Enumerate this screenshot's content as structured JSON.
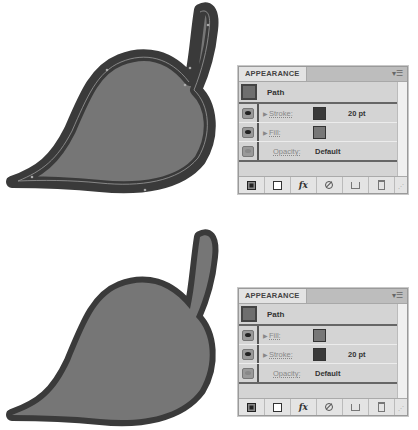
{
  "figures": [
    {
      "leaf": {
        "description": "leaf-with-stroke-selected",
        "fill_color": "#767676",
        "stroke_color": "#3a3a3a",
        "selected": true
      },
      "panel": {
        "title": "APPEARANCE",
        "object": "Path",
        "rows": [
          {
            "type": "stroke",
            "label": "Stroke:",
            "swatch": "#3a3a3a",
            "value": "20 pt"
          },
          {
            "type": "fill",
            "label": "Fill:",
            "swatch": "#777777",
            "value": ""
          },
          {
            "type": "opacity",
            "label": "Opacity:",
            "value": "Default"
          }
        ],
        "footer": [
          "new-stroke-icon",
          "new-fill-icon",
          "fx-icon",
          "clear-icon",
          "duplicate-icon",
          "trash-icon"
        ]
      }
    },
    {
      "leaf": {
        "description": "leaf-with-fill-on-top",
        "fill_color": "#767676",
        "stroke_color": "#3a3a3a",
        "selected": false
      },
      "panel": {
        "title": "APPEARANCE",
        "object": "Path",
        "rows": [
          {
            "type": "fill",
            "label": "Fill:",
            "swatch": "#777777",
            "value": ""
          },
          {
            "type": "stroke",
            "label": "Stroke:",
            "swatch": "#3a3a3a",
            "value": "20 pt"
          },
          {
            "type": "opacity",
            "label": "Opacity:",
            "value": "Default"
          }
        ],
        "footer": [
          "new-stroke-icon",
          "new-fill-icon",
          "fx-icon",
          "clear-icon",
          "duplicate-icon",
          "trash-icon"
        ]
      }
    }
  ],
  "fx_label": "fx"
}
